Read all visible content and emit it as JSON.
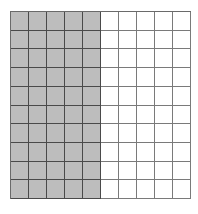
{
  "diagram": {
    "type": "hundred-grid",
    "rows": 10,
    "columns": 10,
    "shaded_columns": 5,
    "shaded_count": 50,
    "total_count": 100,
    "colors": {
      "shaded_fill": "#bdbdbd",
      "unshaded_fill": "#ffffff",
      "shaded_line": "#4a4a4a",
      "unshaded_line": "#7a7a7a"
    }
  }
}
